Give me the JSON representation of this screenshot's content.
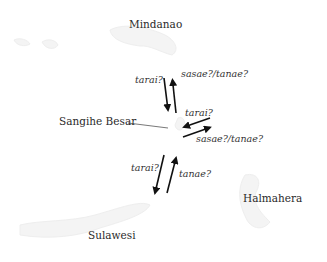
{
  "places": {
    "mindanao": "Mindanao",
    "sangihe_besar": "Sangihe Besar",
    "halmahera": "Halmahera",
    "sulawesi": "Sulawesi"
  },
  "routes": {
    "north": {
      "outbound_term": "tarai?",
      "inbound_term": "sasae?/tanae?"
    },
    "east": {
      "inbound_term": "tarai?",
      "outbound_term": "sasae?/tanae?"
    },
    "south": {
      "outbound_term": "tarai?",
      "inbound_term": "tanae?"
    }
  },
  "colors": {
    "ink": "#111111",
    "text": "#2a2a2a",
    "map_faint": "#f3f3f3"
  }
}
